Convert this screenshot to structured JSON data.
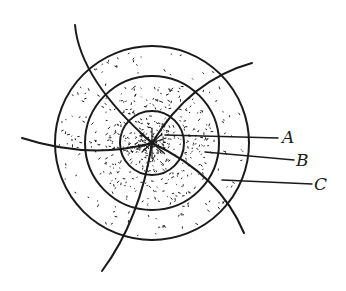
{
  "diagram": {
    "type": "concentric-zone sketch",
    "center": [
      152,
      143
    ],
    "rings": [
      {
        "id": "inner",
        "radius": 32,
        "stipple": "dense"
      },
      {
        "id": "middle",
        "radius": 67,
        "stipple": "medium"
      },
      {
        "id": "outer",
        "radius": 97,
        "stipple": "sparse"
      }
    ],
    "labels": [
      {
        "text": "A",
        "x": 282,
        "y": 140
      },
      {
        "text": "B",
        "x": 296,
        "y": 165
      },
      {
        "text": "C",
        "x": 314,
        "y": 189
      }
    ],
    "ink_color": "#1a1a1a"
  }
}
